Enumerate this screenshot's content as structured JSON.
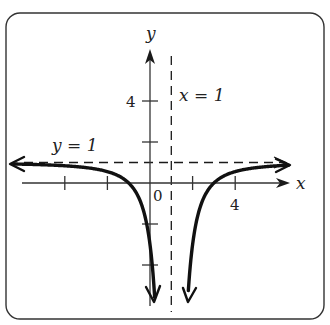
{
  "figure": {
    "frame": {
      "left": 6,
      "top": 13,
      "right": 324,
      "bottom": 319,
      "radius": 14
    },
    "colors": {
      "ink": "#1a1a1a",
      "axis": "#333333",
      "background": "#ffffff"
    },
    "origin_px": {
      "x": 150,
      "y": 183
    },
    "unit_px": {
      "x": 21.3,
      "y": 20.5
    },
    "axes": {
      "x_label": "x",
      "y_label": "y",
      "origin_label": "0",
      "x_tick_values": [
        -4,
        -2,
        2,
        4
      ],
      "x_tick_labels": [
        {
          "value": 4,
          "text": "4"
        }
      ],
      "y_tick_values": [
        4,
        2,
        -2,
        -4
      ],
      "y_tick_labels": [
        {
          "value": 4,
          "text": "4"
        }
      ]
    },
    "asymptotes": {
      "vertical": {
        "x": 1,
        "label": "x = 1"
      },
      "horizontal": {
        "y": 1,
        "label": "y = 1"
      }
    },
    "function": {
      "expression": "y = 1 - 4/(x-1)^2",
      "x_intercepts": [
        -1,
        3
      ],
      "y_intercept": -3
    }
  },
  "chart_data": {
    "type": "line",
    "title": "",
    "xlabel": "x",
    "ylabel": "y",
    "xlim": [
      -6.5,
      6.6
    ],
    "ylim": [
      -6.5,
      6.5
    ],
    "grid": false,
    "series": [
      {
        "name": "left branch",
        "x": [
          -6.5,
          -5,
          -4,
          -3,
          -2,
          -1,
          -0.5,
          0,
          0.2,
          0.25
        ],
        "y": [
          0.93,
          0.89,
          0.84,
          0.75,
          0.56,
          0.0,
          -0.78,
          -3.0,
          -5.25,
          -6.11
        ]
      },
      {
        "name": "right branch",
        "x": [
          1.75,
          1.8,
          2,
          2.5,
          3,
          4,
          5,
          6,
          6.6
        ],
        "y": [
          -6.11,
          -5.25,
          -3.0,
          -0.78,
          0.0,
          0.56,
          0.75,
          0.84,
          0.87
        ]
      }
    ],
    "annotations": [
      {
        "text": "x = 1",
        "type": "vertical asymptote",
        "x": 1
      },
      {
        "text": "y = 1",
        "type": "horizontal asymptote",
        "y": 1
      },
      {
        "text": "4",
        "on": "x-axis",
        "x": 4
      },
      {
        "text": "4",
        "on": "y-axis",
        "y": 4
      },
      {
        "text": "0",
        "on": "origin"
      }
    ]
  }
}
